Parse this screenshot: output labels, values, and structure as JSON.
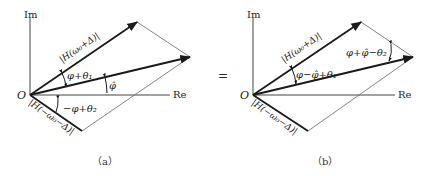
{
  "equals_sign": "=",
  "panels": [
    {
      "id": "a",
      "caption": "（a）",
      "axes": {
        "im_label": "Im",
        "re_label": "Re",
        "origin_label": "O"
      },
      "vectors": {
        "upper_label": "|H(ω₀+Δ)|",
        "lower_label": "|H(−ω₀−Δ)|"
      },
      "angles": {
        "upper_to_resultant": "φ+θ₁",
        "resultant_to_re": "φ̂",
        "lower_to_re": "−φ+θ₂"
      }
    },
    {
      "id": "b",
      "caption": "（b）",
      "axes": {
        "im_label": "Im",
        "re_label": "Re",
        "origin_label": "O"
      },
      "vectors": {
        "upper_label": "|H(ω₀+Δ)|",
        "lower_label": "|H(−ω₀−Δ)|"
      },
      "angles": {
        "upper_to_resultant": "φ−φ̂+θ₁",
        "resultant_to_parallel": "φ+φ̂−θ₂"
      }
    }
  ],
  "colors": {
    "thick": "#1a1a1a",
    "thin": "#555555",
    "axis": "#444444"
  }
}
